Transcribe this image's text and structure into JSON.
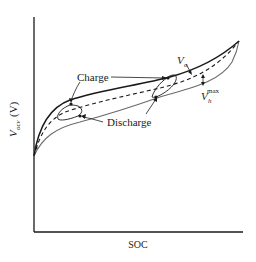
{
  "figure": {
    "type": "hysteresis-diagram",
    "xlabel": "SOC",
    "ylabel_main": "V",
    "ylabel_sub": "ocv",
    "ylabel_unit": "(V)",
    "annotations": {
      "charge": "Charge",
      "discharge": "Discharge",
      "vo_main": "V",
      "vo_sub": "o",
      "vh_main": "V",
      "vh_sub": "h",
      "vh_sup": "max"
    },
    "curves": [
      {
        "name": "charge-boundary",
        "style": "solid-bold"
      },
      {
        "name": "ocv-average",
        "style": "dashed"
      },
      {
        "name": "discharge-boundary",
        "style": "solid-thin"
      }
    ],
    "minor_loops": 2
  }
}
